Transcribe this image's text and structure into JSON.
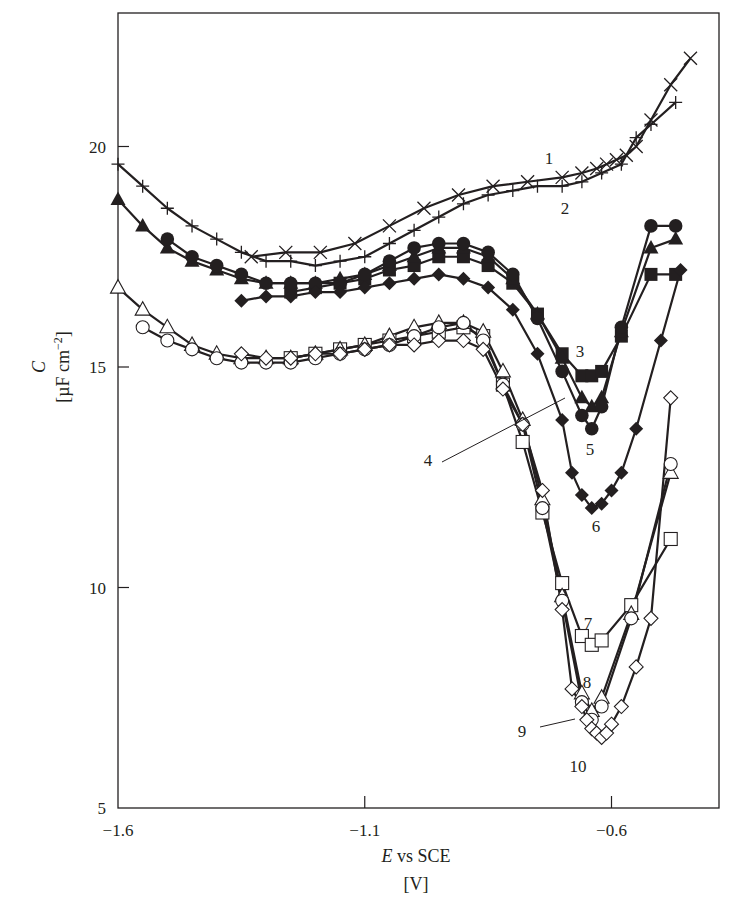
{
  "chart_data": {
    "type": "line",
    "title": "",
    "xlabel": "E vs SCE",
    "xlabel_italic_part": "E",
    "xlabel_rest": " vs SCE",
    "xunit": "[V]",
    "ylabel": "C",
    "yunit": "[µF cm⁻²]",
    "yunit_base": "[µF cm",
    "yunit_exp": "−2",
    "yunit_close": "]",
    "xlim": [
      -1.6,
      -0.38
    ],
    "ylim": [
      5,
      23
    ],
    "xticks": [
      -1.6,
      -1.1,
      -0.6
    ],
    "xtick_labels": [
      "−1.6",
      "−1.1",
      "−0.6"
    ],
    "yticks": [
      5,
      10,
      15,
      20
    ],
    "ytick_labels": [
      "5",
      "10",
      "15",
      "20"
    ],
    "grid": false,
    "legend": "inline numeric labels 1–10",
    "series": [
      {
        "name": "1",
        "marker": "x",
        "x": [
          -1.33,
          -1.26,
          -1.19,
          -1.12,
          -1.05,
          -0.98,
          -0.91,
          -0.84,
          -0.77,
          -0.7,
          -0.66,
          -0.63,
          -0.61,
          -0.59,
          -0.57,
          -0.55,
          -0.52,
          -0.48,
          -0.44
        ],
        "y": [
          17.5,
          17.6,
          17.6,
          17.8,
          18.2,
          18.6,
          18.9,
          19.1,
          19.2,
          19.3,
          19.4,
          19.5,
          19.6,
          19.7,
          19.8,
          20.0,
          20.6,
          21.4,
          22.0
        ]
      },
      {
        "name": "2",
        "marker": "+",
        "x": [
          -1.6,
          -1.55,
          -1.5,
          -1.45,
          -1.4,
          -1.35,
          -1.3,
          -1.25,
          -1.2,
          -1.15,
          -1.1,
          -1.05,
          -1.0,
          -0.95,
          -0.9,
          -0.85,
          -0.8,
          -0.75,
          -0.7,
          -0.66,
          -0.62,
          -0.58,
          -0.55,
          -0.52,
          -0.47
        ],
        "y": [
          19.6,
          19.1,
          18.6,
          18.2,
          17.9,
          17.6,
          17.4,
          17.4,
          17.3,
          17.4,
          17.5,
          17.8,
          18.1,
          18.4,
          18.7,
          18.9,
          19.0,
          19.1,
          19.1,
          19.2,
          19.4,
          19.6,
          20.2,
          20.5,
          21.0
        ]
      },
      {
        "name": "3",
        "marker": "filled-square",
        "x": [
          -1.25,
          -1.2,
          -1.15,
          -1.1,
          -1.05,
          -1.0,
          -0.95,
          -0.9,
          -0.85,
          -0.8,
          -0.75,
          -0.7,
          -0.66,
          -0.64,
          -0.62,
          -0.58,
          -0.52,
          -0.47
        ],
        "y": [
          16.7,
          16.8,
          16.9,
          17.0,
          17.2,
          17.3,
          17.5,
          17.5,
          17.3,
          16.9,
          16.2,
          15.3,
          14.8,
          14.8,
          14.9,
          15.7,
          17.1,
          17.1
        ]
      },
      {
        "name": "4",
        "marker": "filled-triangle",
        "x": [
          -1.6,
          -1.55,
          -1.5,
          -1.45,
          -1.4,
          -1.35,
          -1.3,
          -1.25,
          -1.2,
          -1.15,
          -1.1,
          -1.05,
          -1.0,
          -0.95,
          -0.9,
          -0.85,
          -0.8,
          -0.75,
          -0.7,
          -0.66,
          -0.64,
          -0.62,
          -0.58,
          -0.52,
          -0.47
        ],
        "y": [
          18.8,
          18.2,
          17.7,
          17.4,
          17.2,
          17.0,
          16.9,
          16.9,
          16.9,
          17.0,
          17.1,
          17.3,
          17.5,
          17.7,
          17.7,
          17.5,
          17.0,
          16.2,
          15.2,
          14.3,
          14.1,
          14.3,
          15.8,
          17.7,
          17.9
        ]
      },
      {
        "name": "5",
        "marker": "filled-circle",
        "x": [
          -1.5,
          -1.45,
          -1.4,
          -1.35,
          -1.3,
          -1.25,
          -1.2,
          -1.15,
          -1.1,
          -1.05,
          -1.0,
          -0.95,
          -0.9,
          -0.85,
          -0.8,
          -0.75,
          -0.7,
          -0.66,
          -0.64,
          -0.62,
          -0.58,
          -0.52,
          -0.47
        ],
        "y": [
          17.9,
          17.5,
          17.3,
          17.1,
          16.9,
          16.9,
          16.9,
          16.9,
          17.1,
          17.4,
          17.7,
          17.8,
          17.8,
          17.6,
          17.1,
          16.1,
          14.9,
          13.9,
          13.6,
          14.1,
          15.9,
          18.2,
          18.2
        ]
      },
      {
        "name": "6",
        "marker": "filled-diamond",
        "x": [
          -1.35,
          -1.3,
          -1.25,
          -1.2,
          -1.15,
          -1.1,
          -1.05,
          -1.0,
          -0.95,
          -0.9,
          -0.85,
          -0.8,
          -0.75,
          -0.7,
          -0.68,
          -0.66,
          -0.64,
          -0.62,
          -0.6,
          -0.58,
          -0.55,
          -0.5,
          -0.46
        ],
        "y": [
          16.5,
          16.6,
          16.6,
          16.7,
          16.7,
          16.8,
          16.9,
          17.0,
          17.1,
          17.0,
          16.8,
          16.3,
          15.3,
          13.8,
          12.6,
          12.1,
          11.8,
          11.9,
          12.2,
          12.6,
          13.6,
          15.6,
          17.2
        ]
      },
      {
        "name": "7",
        "marker": "open-square",
        "x": [
          -1.25,
          -1.2,
          -1.15,
          -1.1,
          -1.05,
          -1.0,
          -0.95,
          -0.9,
          -0.86,
          -0.82,
          -0.78,
          -0.74,
          -0.7,
          -0.66,
          -0.64,
          -0.62,
          -0.56,
          -0.48
        ],
        "y": [
          15.2,
          15.3,
          15.4,
          15.5,
          15.6,
          15.7,
          15.8,
          15.9,
          15.7,
          14.6,
          13.3,
          11.7,
          10.1,
          8.9,
          8.7,
          8.8,
          9.6,
          11.1
        ]
      },
      {
        "name": "8",
        "marker": "open-triangle",
        "x": [
          -1.6,
          -1.55,
          -1.5,
          -1.45,
          -1.4,
          -1.35,
          -1.3,
          -1.25,
          -1.2,
          -1.15,
          -1.1,
          -1.05,
          -1.0,
          -0.95,
          -0.9,
          -0.86,
          -0.82,
          -0.78,
          -0.74,
          -0.7,
          -0.66,
          -0.64,
          -0.62,
          -0.56,
          -0.48
        ],
        "y": [
          16.8,
          16.3,
          15.9,
          15.5,
          15.3,
          15.2,
          15.2,
          15.2,
          15.3,
          15.4,
          15.5,
          15.7,
          15.9,
          16.0,
          16.0,
          15.8,
          14.9,
          13.8,
          12.0,
          9.8,
          7.6,
          7.2,
          7.5,
          9.4,
          12.6
        ]
      },
      {
        "name": "9",
        "marker": "open-circle",
        "x": [
          -1.55,
          -1.5,
          -1.45,
          -1.4,
          -1.35,
          -1.3,
          -1.25,
          -1.2,
          -1.15,
          -1.1,
          -1.05,
          -1.0,
          -0.95,
          -0.9,
          -0.86,
          -0.82,
          -0.78,
          -0.74,
          -0.7,
          -0.66,
          -0.64,
          -0.62,
          -0.56,
          -0.48
        ],
        "y": [
          15.9,
          15.6,
          15.4,
          15.2,
          15.1,
          15.1,
          15.1,
          15.2,
          15.3,
          15.4,
          15.5,
          15.7,
          15.9,
          16.0,
          15.6,
          14.6,
          13.7,
          11.8,
          9.7,
          7.4,
          7.0,
          7.3,
          9.3,
          12.8
        ]
      },
      {
        "name": "10",
        "marker": "open-diamond",
        "x": [
          -1.35,
          -1.3,
          -1.25,
          -1.2,
          -1.15,
          -1.1,
          -1.05,
          -1.0,
          -0.95,
          -0.9,
          -0.86,
          -0.82,
          -0.78,
          -0.74,
          -0.7,
          -0.68,
          -0.66,
          -0.65,
          -0.64,
          -0.63,
          -0.62,
          -0.61,
          -0.6,
          -0.58,
          -0.55,
          -0.52,
          -0.48
        ],
        "y": [
          15.3,
          15.2,
          15.2,
          15.3,
          15.3,
          15.4,
          15.5,
          15.5,
          15.6,
          15.6,
          15.4,
          14.5,
          13.7,
          12.2,
          9.5,
          7.7,
          7.3,
          7.0,
          6.8,
          6.7,
          6.6,
          6.7,
          6.9,
          7.3,
          8.2,
          9.3,
          14.3
        ]
      }
    ],
    "annotations": [
      {
        "text": "1",
        "x_px": 549,
        "y_px": 164
      },
      {
        "text": "2",
        "x_px": 565,
        "y_px": 214
      },
      {
        "text": "3",
        "x_px": 580,
        "y_px": 357
      },
      {
        "text": "4",
        "x_px": 428,
        "y_px": 466,
        "leader": [
          442,
          462,
          565,
          398
        ]
      },
      {
        "text": "5",
        "x_px": 590,
        "y_px": 455
      },
      {
        "text": "6",
        "x_px": 596,
        "y_px": 532
      },
      {
        "text": "7",
        "x_px": 588,
        "y_px": 629
      },
      {
        "text": "8",
        "x_px": 587,
        "y_px": 688
      },
      {
        "text": "9",
        "x_px": 522,
        "y_px": 737,
        "leader": [
          540,
          727,
          575,
          719
        ]
      },
      {
        "text": "10",
        "x_px": 578,
        "y_px": 772
      }
    ]
  }
}
